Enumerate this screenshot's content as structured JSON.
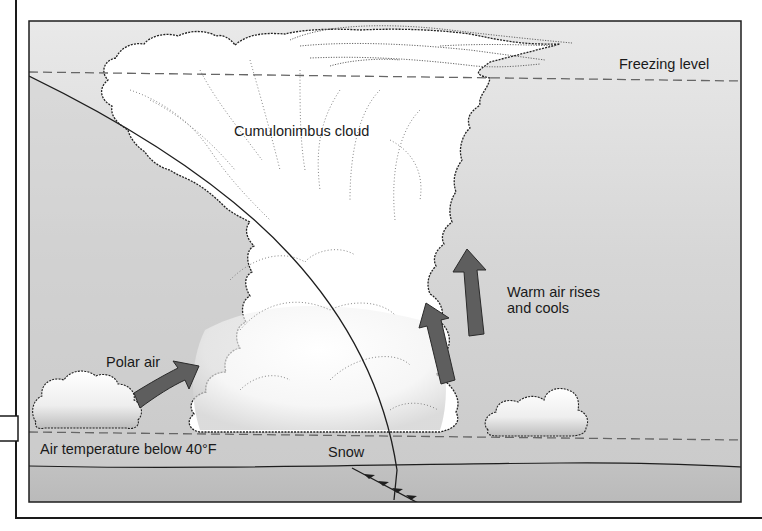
{
  "diagram": {
    "labels": {
      "cloud": "Cumulonimbus cloud",
      "freezing_level": "Freezing level",
      "warm_air_line1": "Warm air rises",
      "warm_air_line2": "and cools",
      "polar_air": "Polar air",
      "air_temperature": "Air temperature below 40°F",
      "snow": "Snow"
    },
    "levels": [
      {
        "name": "freezing-level",
        "style": "dashed"
      },
      {
        "name": "air-temperature-below-40F",
        "style": "dashed"
      },
      {
        "name": "ground",
        "style": "solid"
      }
    ],
    "arrows": [
      {
        "name": "polar-air-arrow",
        "direction": "up-right"
      },
      {
        "name": "warm-air-arrow-left",
        "direction": "up"
      },
      {
        "name": "warm-air-arrow-right",
        "direction": "up"
      }
    ],
    "colors": {
      "sky_top": "#e6e6e6",
      "sky_bottom": "#c4c4c4",
      "ground": "#bdbdbd",
      "cloud": "#ffffff",
      "arrow": "#5e5e5e",
      "line": "#1e1e1e",
      "dash": "#6a6a6a"
    }
  }
}
